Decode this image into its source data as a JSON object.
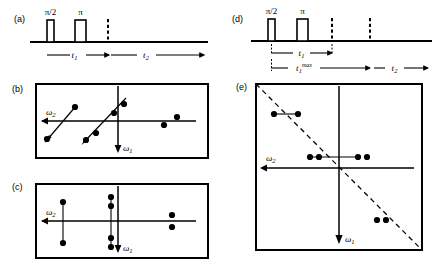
{
  "figure": {
    "type": "nmr-2d-pulse-sequence-and-spectra-diagram",
    "background": "#ffffff",
    "ink": "#000000",
    "panels": [
      {
        "id": "a",
        "label": "(a)",
        "kind": "pulse-sequence",
        "pulses": [
          {
            "name": "pi-over-2-pulse",
            "label": "π/2"
          },
          {
            "name": "pi-pulse",
            "label": "π"
          }
        ],
        "dashed_markers": 1,
        "intervals": [
          {
            "name": "t1-interval",
            "label": "t",
            "subscript": "1"
          },
          {
            "name": "t2-interval",
            "label": "t",
            "subscript": "2"
          }
        ]
      },
      {
        "id": "d",
        "label": "(d)",
        "kind": "pulse-sequence",
        "pulses": [
          {
            "name": "pi-over-2-pulse",
            "label": "π/2"
          },
          {
            "name": "pi-pulse",
            "label": "π"
          }
        ],
        "dashed_markers": 2,
        "intervals": [
          {
            "name": "t1-interval",
            "label": "t",
            "subscript": "1"
          },
          {
            "name": "t1max-interval",
            "label": "t",
            "subscript": "1",
            "superscript": "max"
          },
          {
            "name": "t2-interval",
            "label": "t",
            "subscript": "2"
          }
        ]
      },
      {
        "id": "b",
        "label": "(b)",
        "kind": "spectrum-2d",
        "shape": "rectangle",
        "axes": [
          {
            "name": "omega2-axis",
            "label": "ω",
            "subscript": "2",
            "direction": "left"
          },
          {
            "name": "omega1-axis",
            "label": "ω",
            "subscript": "1",
            "direction": "down"
          }
        ],
        "tilt": "diagonal-arrow-connectors",
        "peak_groups": [
          {
            "name": "peak-group-left",
            "connector": "diagonal-arrow",
            "peaks": 2
          },
          {
            "name": "peak-group-center",
            "connector": "diagonal-arrow",
            "peaks": 4
          },
          {
            "name": "peak-group-right",
            "connector": "none",
            "peaks": 2
          }
        ]
      },
      {
        "id": "c",
        "label": "(c)",
        "kind": "spectrum-2d",
        "shape": "rectangle",
        "axes": [
          {
            "name": "omega2-axis",
            "label": "ω",
            "subscript": "2",
            "direction": "left"
          },
          {
            "name": "omega1-axis",
            "label": "ω",
            "subscript": "1",
            "direction": "down"
          }
        ],
        "tilt": "vertical-line-connectors",
        "peak_groups": [
          {
            "name": "peak-group-left",
            "connector": "vertical-line",
            "peaks": 2
          },
          {
            "name": "peak-group-center",
            "connector": "vertical-line",
            "peaks": 4
          },
          {
            "name": "peak-group-right",
            "connector": "none",
            "peaks": 2
          }
        ]
      },
      {
        "id": "e",
        "label": "(e)",
        "kind": "spectrum-2d",
        "shape": "square",
        "axes": [
          {
            "name": "omega2-axis",
            "label": "ω",
            "subscript": "2",
            "direction": "left"
          },
          {
            "name": "omega1-axis",
            "label": "ω",
            "subscript": "1",
            "direction": "down"
          }
        ],
        "diagonal": {
          "name": "dashed-diagonal",
          "style": "dashed",
          "orientation": "anti-diagonal"
        },
        "peak_groups": [
          {
            "name": "peak-group-upper-left",
            "connector": "horizontal-line",
            "peaks": 2
          },
          {
            "name": "peak-group-center-row",
            "connector": "horizontal-line",
            "peaks": 4
          },
          {
            "name": "peak-group-lower-right",
            "connector": "none",
            "peaks": 2
          }
        ]
      }
    ]
  }
}
